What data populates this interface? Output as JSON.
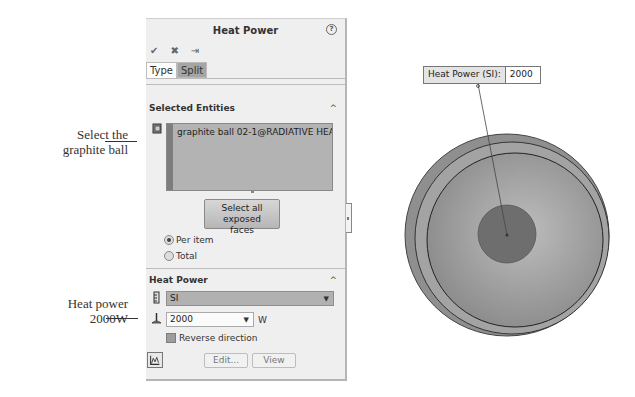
{
  "annotations": {
    "select_ball": "Select the graphite ball",
    "select_ball_line1": "Select the",
    "select_ball_line2": "graphite ball",
    "heat_power_line1": "Heat power",
    "heat_power_line2": "2000W"
  },
  "panel": {
    "title": "Heat Power",
    "help_glyph": "?",
    "actions": {
      "ok_glyph": "✔",
      "cancel_glyph": "✖",
      "pin_glyph": "⇥"
    },
    "tabs": [
      {
        "label": "Type",
        "active": true
      },
      {
        "label": "Split",
        "active": false
      }
    ],
    "selected_entities": {
      "header": "Selected Entities",
      "collapse_glyph": "^",
      "items": [
        "graphite ball 02-1@RADIATIVE HEAT TRA"
      ],
      "select_all_button": "Select all exposed faces",
      "select_all_line1": "Select all exposed",
      "select_all_line2": "faces",
      "radio_options": [
        {
          "label": "Per item",
          "selected": true
        },
        {
          "label": "Total",
          "selected": false
        }
      ]
    },
    "heat_power": {
      "header": "Heat Power",
      "collapse_glyph": "^",
      "unit_system": "SI",
      "unit_system_display": "SI",
      "value": "2000",
      "unit": "W",
      "reverse_direction_label": "Reverse direction",
      "reverse_direction_checked": false,
      "edit_button": "Edit...",
      "view_button": "View"
    }
  },
  "graphics": {
    "callout_label": "Heat Power (SI):",
    "callout_value": "2000"
  }
}
